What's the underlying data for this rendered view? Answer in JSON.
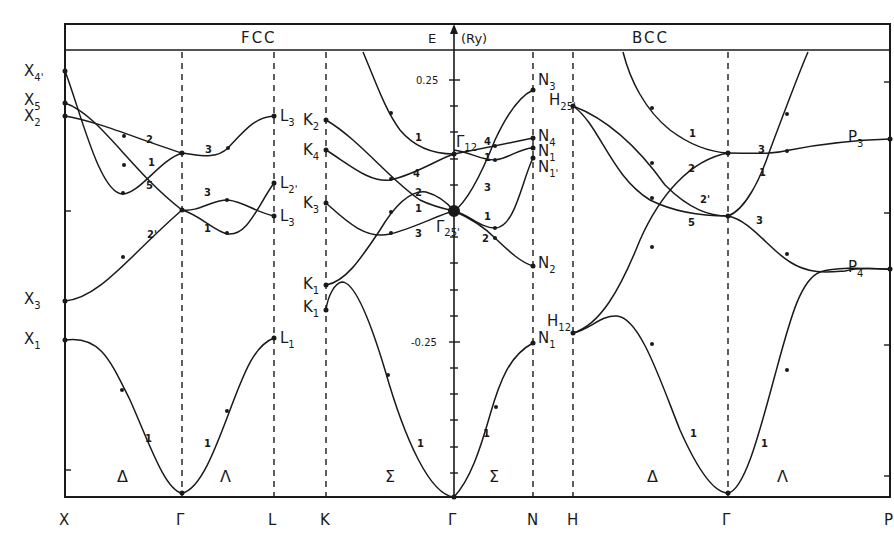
{
  "header": {
    "fcc_title": "FCC",
    "bcc_title": "BCC",
    "energy_label": "E",
    "unit_label": "(Ry)"
  },
  "axis": {
    "tick_pos": "0.25",
    "tick_neg": "-0.25"
  },
  "k_points": [
    "X",
    "Γ",
    "L",
    "K",
    "Γ",
    "N",
    "H",
    "Γ",
    "P"
  ],
  "directions": {
    "fcc_delta": "Δ",
    "fcc_lambda": "Λ",
    "fcc_sigma": "Σ",
    "bcc_sigma": "Σ",
    "bcc_delta": "Δ",
    "bcc_lambda": "Λ"
  },
  "fcc_labels": {
    "X4p": {
      "main": "X",
      "sub": "4'"
    },
    "X5": {
      "main": "X",
      "sub": "5"
    },
    "X2": {
      "main": "X",
      "sub": "2"
    },
    "X3": {
      "main": "X",
      "sub": "3"
    },
    "X1": {
      "main": "X",
      "sub": "1"
    },
    "L3a": {
      "main": "L",
      "sub": "3"
    },
    "L2p": {
      "main": "L",
      "sub": "2'"
    },
    "L3b": {
      "main": "L",
      "sub": "3"
    },
    "L1": {
      "main": "L",
      "sub": "1"
    },
    "K2": {
      "main": "K",
      "sub": "2"
    },
    "K4": {
      "main": "K",
      "sub": "4"
    },
    "K3": {
      "main": "K",
      "sub": "3"
    },
    "K1a": {
      "main": "K",
      "sub": "1"
    },
    "K1b": {
      "main": "K",
      "sub": "1"
    }
  },
  "center_labels": {
    "G12": {
      "main": "Γ",
      "sub": "12"
    },
    "G25p": {
      "main": "Γ",
      "sub": "25'"
    }
  },
  "bcc_labels": {
    "N3": {
      "main": "N",
      "sub": "3"
    },
    "N4": {
      "main": "N",
      "sub": "4"
    },
    "N1a": {
      "main": "N",
      "sub": "1"
    },
    "N1p": {
      "main": "N",
      "sub": "1'"
    },
    "N2": {
      "main": "N",
      "sub": "2"
    },
    "N1b": {
      "main": "N",
      "sub": "1"
    },
    "H25p": {
      "main": "H",
      "sub": "25'"
    },
    "H12": {
      "main": "H",
      "sub": "12"
    },
    "P3": {
      "main": "P",
      "sub": "3"
    },
    "P4": {
      "main": "P",
      "sub": "4"
    }
  },
  "band_indices": {
    "fcc_d_2": "2",
    "fcc_d_1": "1",
    "fcc_d_5": "5",
    "fcc_d_2p": "2'",
    "fcc_d_low": "1",
    "fcc_l_3a": "3",
    "fcc_l_3b": "3",
    "fcc_l_1": "1",
    "fcc_l_low": "1",
    "fcc_s_1": "1",
    "fcc_s_4": "4",
    "fcc_s_2": "2",
    "fcc_s_1b": "1",
    "fcc_s_3": "3",
    "fcc_s_low": "1",
    "bcc_s_4": "4",
    "bcc_s_1": "1",
    "bcc_s_3": "3",
    "bcc_s_1b": "1",
    "bcc_s_2": "2",
    "bcc_s_low": "1",
    "bcc_d_1": "1",
    "bcc_d_2": "2",
    "bcc_d_2p": "2'",
    "bcc_d_5": "5",
    "bcc_d_low": "1",
    "bcc_l_3a": "3",
    "bcc_l_1": "1",
    "bcc_l_3b": "3",
    "bcc_l_low": "1"
  }
}
